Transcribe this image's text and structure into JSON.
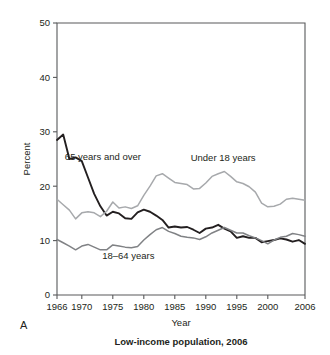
{
  "figure": {
    "panel_label": "A",
    "caption": "Low-income population, 2006",
    "xlabel": "Year",
    "ylabel": "Percent"
  },
  "chart_data": {
    "type": "line",
    "title": "Low-income population, 2006",
    "xlabel": "Year",
    "ylabel": "Percent",
    "xlim": [
      1966,
      2006
    ],
    "ylim": [
      0,
      50
    ],
    "xticks": [
      1966,
      1970,
      1975,
      1980,
      1985,
      1990,
      1995,
      2000,
      2006
    ],
    "xtick_labels": [
      "1966",
      "1970",
      "1975",
      "1980",
      "1985",
      "1990",
      "1995",
      "2000",
      "2006"
    ],
    "yticks": [
      0,
      10,
      20,
      30,
      40,
      50
    ],
    "ytick_labels": [
      "0",
      "10",
      "20",
      "30",
      "40",
      "50"
    ],
    "grid": false,
    "legend_position": "inline-annotations",
    "x": [
      1966,
      1967,
      1968,
      1969,
      1970,
      1971,
      1972,
      1973,
      1974,
      1975,
      1976,
      1977,
      1978,
      1979,
      1980,
      1981,
      1982,
      1983,
      1984,
      1985,
      1986,
      1987,
      1988,
      1989,
      1990,
      1991,
      1992,
      1993,
      1994,
      1995,
      1996,
      1997,
      1998,
      1999,
      2000,
      2001,
      2002,
      2003,
      2004,
      2005,
      2006
    ],
    "series": [
      {
        "name": "65 years and over",
        "color": "#231f20",
        "width": 1.9,
        "label_x": 1973.4,
        "label_y": 24.8,
        "values": [
          28.5,
          29.5,
          25.0,
          25.3,
          24.6,
          21.6,
          18.6,
          16.3,
          14.6,
          15.3,
          15.0,
          14.1,
          14.0,
          15.2,
          15.7,
          15.3,
          14.6,
          13.8,
          12.4,
          12.6,
          12.4,
          12.5,
          12.0,
          11.4,
          12.2,
          12.4,
          12.9,
          12.2,
          11.7,
          10.5,
          10.8,
          10.5,
          10.5,
          9.7,
          9.9,
          10.1,
          10.4,
          10.2,
          9.8,
          10.1,
          9.4
        ]
      },
      {
        "name": "Under 18 years",
        "color": "#a7a9ac",
        "width": 1.5,
        "label_x": 1992.8,
        "label_y": 24.6,
        "values": [
          17.6,
          16.6,
          15.6,
          14.0,
          15.1,
          15.3,
          15.1,
          14.4,
          15.4,
          17.1,
          16.0,
          16.2,
          15.9,
          16.4,
          18.3,
          20.0,
          21.9,
          22.3,
          21.5,
          20.7,
          20.5,
          20.3,
          19.5,
          19.6,
          20.6,
          21.8,
          22.3,
          22.7,
          21.8,
          20.8,
          20.5,
          19.9,
          18.9,
          16.9,
          16.2,
          16.3,
          16.7,
          17.6,
          17.8,
          17.6,
          17.4
        ]
      },
      {
        "name": "18–64 years",
        "color": "#808285",
        "width": 1.5,
        "label_x": 1977.5,
        "label_y": 6.7,
        "values": [
          10.2,
          9.6,
          9.0,
          8.3,
          9.0,
          9.3,
          8.8,
          8.3,
          8.3,
          9.2,
          9.0,
          8.8,
          8.7,
          8.9,
          10.1,
          11.1,
          12.0,
          12.4,
          11.7,
          11.3,
          10.8,
          10.6,
          10.5,
          10.2,
          10.7,
          11.4,
          11.9,
          12.4,
          11.9,
          11.4,
          11.4,
          10.9,
          10.5,
          10.0,
          9.4,
          10.1,
          10.6,
          10.8,
          11.3,
          11.1,
          10.8
        ]
      }
    ]
  }
}
